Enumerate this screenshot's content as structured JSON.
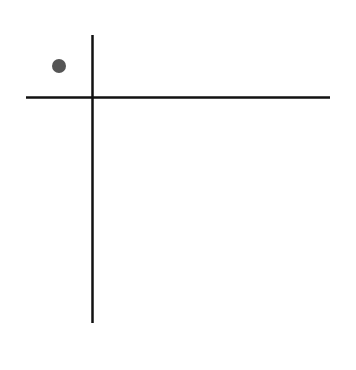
{
  "diagram": {
    "background": "#ffffff",
    "vertical_axis": {
      "x": 92.5,
      "y1": 35,
      "y2": 323,
      "color": "#111111",
      "width": 2.5
    },
    "horizontal_axis": {
      "y": 97.5,
      "x1": 26,
      "x2": 330,
      "color": "#111111",
      "width": 2.5
    },
    "points": [
      {
        "cx": 59,
        "cy": 66,
        "r": 7,
        "color": "#555555",
        "quadrant": "upper-left"
      }
    ]
  }
}
